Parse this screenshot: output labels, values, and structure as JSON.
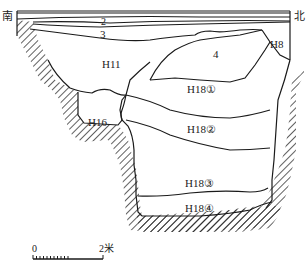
{
  "figure": {
    "type": "archaeological-section-profile",
    "orientation": {
      "left": "南",
      "right": "北"
    },
    "colors": {
      "line": "#1a1a1a",
      "background": "#ffffff",
      "hatch": "#1a1a1a"
    }
  },
  "layers": [
    {
      "id": "1",
      "label": "1"
    },
    {
      "id": "2",
      "label": "2"
    },
    {
      "id": "3",
      "label": "3"
    },
    {
      "id": "4",
      "label": "4"
    }
  ],
  "features": [
    {
      "id": "H8",
      "label": "H8"
    },
    {
      "id": "H11",
      "label": "H11"
    },
    {
      "id": "H16",
      "label": "H16"
    },
    {
      "id": "H18-1",
      "label": "H18①"
    },
    {
      "id": "H18-2",
      "label": "H18②"
    },
    {
      "id": "H18-3",
      "label": "H18③"
    },
    {
      "id": "H18-4",
      "label": "H18④"
    }
  ],
  "scale_bar": {
    "start": "0",
    "end": "2米"
  }
}
